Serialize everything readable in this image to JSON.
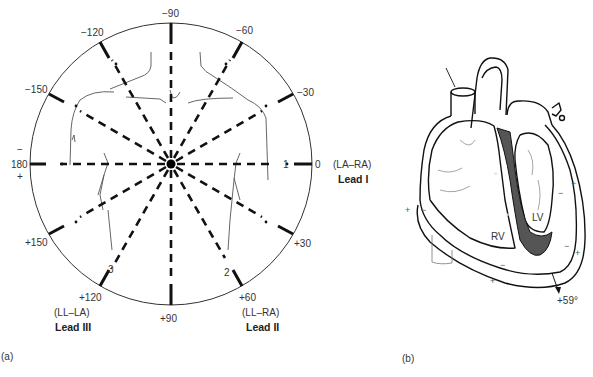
{
  "panel_a": {
    "caption": "(a)",
    "angle_labels": {
      "m90": "−90",
      "m120": "−120",
      "m60": "−60",
      "m150": "−150",
      "m30": "−30",
      "zero": "0",
      "p30": "+30",
      "p60": "+60",
      "p90": "+90",
      "p120": "+120",
      "p150": "+150",
      "deg180": "180",
      "deg180_minus": "−",
      "deg180_plus": "+"
    },
    "lead_numbers": {
      "lead1": "1",
      "lead2": "2",
      "lead3": "3"
    },
    "leads": [
      {
        "name": "Lead I",
        "electrodes": "(LA–RA)"
      },
      {
        "name": "Lead II",
        "electrodes": "(LL–RA)"
      },
      {
        "name": "Lead III",
        "electrodes": "(LL–LA)"
      }
    ]
  },
  "panel_b": {
    "caption": "(b)",
    "labels": {
      "rv": "RV",
      "lv": "LV",
      "axis": "+59°"
    },
    "signs": {
      "plus": "+",
      "minus": "−"
    },
    "colors": {
      "septum_fill": "#555555"
    }
  }
}
